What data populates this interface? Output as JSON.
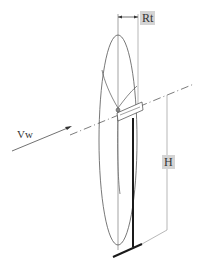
{
  "diagram": {
    "labels": {
      "rotor_radius": "Rt",
      "hub_height": "H",
      "wind_speed": "Vw"
    },
    "colors": {
      "line": "#444444",
      "tower": "#1a1a1a",
      "dimension": "#888888",
      "label_bg": "#d4d4d4"
    }
  }
}
